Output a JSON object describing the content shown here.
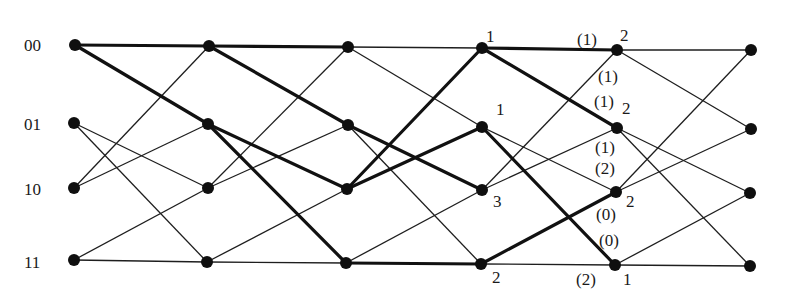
{
  "diagram": {
    "type": "trellis",
    "colors": {
      "background": "#ffffff",
      "edge": "#1e1e1e",
      "edge_survivor": "#111111",
      "node": "#0f0f0f",
      "text": "#1a1a1a"
    },
    "states": [
      "00",
      "01",
      "10",
      "11"
    ],
    "state_labels": [
      {
        "text": "00",
        "x": 24,
        "y": 51
      },
      {
        "text": "01",
        "x": 24,
        "y": 130
      },
      {
        "text": "10",
        "x": 24,
        "y": 195
      },
      {
        "text": "11",
        "x": 24,
        "y": 268
      }
    ],
    "columns": [
      {
        "index": 0,
        "nodes": [
          [
            75,
            45
          ],
          [
            74,
            123
          ],
          [
            74,
            188
          ],
          [
            74,
            260
          ]
        ]
      },
      {
        "index": 1,
        "nodes": [
          [
            209,
            46
          ],
          [
            208,
            124
          ],
          [
            208,
            188
          ],
          [
            207,
            262
          ]
        ]
      },
      {
        "index": 2,
        "nodes": [
          [
            348,
            47
          ],
          [
            348,
            125
          ],
          [
            347,
            189
          ],
          [
            346,
            263
          ]
        ]
      },
      {
        "index": 3,
        "nodes": [
          [
            482,
            48
          ],
          [
            482,
            127
          ],
          [
            482,
            190
          ],
          [
            481,
            264
          ]
        ]
      },
      {
        "index": 4,
        "nodes": [
          [
            617,
            50
          ],
          [
            617,
            128
          ],
          [
            616,
            192
          ],
          [
            615,
            265
          ]
        ]
      },
      {
        "index": 5,
        "nodes": [
          [
            751,
            50
          ],
          [
            751,
            129
          ],
          [
            750,
            193
          ],
          [
            750,
            266
          ]
        ]
      }
    ],
    "transitions": [
      [
        0,
        0
      ],
      [
        0,
        1
      ],
      [
        1,
        2
      ],
      [
        1,
        3
      ],
      [
        2,
        0
      ],
      [
        2,
        1
      ],
      [
        3,
        2
      ],
      [
        3,
        3
      ]
    ],
    "sections": [
      {
        "from": 0,
        "to": 1,
        "bold": [
          [
            0,
            0
          ],
          [
            0,
            1
          ]
        ],
        "thin": [
          [
            1,
            2
          ],
          [
            1,
            3
          ],
          [
            2,
            0
          ],
          [
            2,
            1
          ],
          [
            3,
            2
          ],
          [
            3,
            3
          ]
        ],
        "sources": [
          0,
          1,
          2,
          3
        ]
      },
      {
        "from": 1,
        "to": 2,
        "bold": [
          [
            0,
            0
          ],
          [
            0,
            1
          ],
          [
            1,
            2
          ],
          [
            1,
            3
          ]
        ],
        "thin": [
          [
            2,
            0
          ],
          [
            2,
            1
          ],
          [
            3,
            2
          ],
          [
            3,
            3
          ]
        ]
      },
      {
        "from": 2,
        "to": 3,
        "bold": [
          [
            1,
            2
          ],
          [
            2,
            0
          ],
          [
            2,
            1
          ],
          [
            3,
            3
          ]
        ],
        "thin": [
          [
            0,
            0
          ],
          [
            0,
            1
          ],
          [
            1,
            3
          ],
          [
            3,
            2
          ]
        ]
      },
      {
        "from": 3,
        "to": 4,
        "bold": [
          [
            0,
            0
          ],
          [
            0,
            1
          ],
          [
            1,
            3
          ],
          [
            3,
            2
          ]
        ],
        "thin": [
          [
            1,
            2
          ],
          [
            2,
            0
          ],
          [
            2,
            1
          ],
          [
            3,
            3
          ]
        ]
      },
      {
        "from": 4,
        "to": 5,
        "bold": [],
        "thin": [
          [
            0,
            0
          ],
          [
            0,
            1
          ],
          [
            1,
            2
          ],
          [
            1,
            3
          ],
          [
            2,
            0
          ],
          [
            2,
            1
          ],
          [
            3,
            2
          ],
          [
            3,
            3
          ]
        ]
      }
    ],
    "path_metrics": [
      {
        "column": 3,
        "state": "00",
        "text": "1",
        "x": 486,
        "y": 42
      },
      {
        "column": 3,
        "state": "01",
        "text": "1",
        "x": 496,
        "y": 115
      },
      {
        "column": 3,
        "state": "10",
        "text": "3",
        "x": 493,
        "y": 207
      },
      {
        "column": 3,
        "state": "11",
        "text": "2",
        "x": 492,
        "y": 283
      },
      {
        "column": 4,
        "state": "00",
        "text": "2",
        "x": 620,
        "y": 41
      },
      {
        "column": 4,
        "state": "01",
        "text": "2",
        "x": 622,
        "y": 114
      },
      {
        "column": 4,
        "state": "10",
        "text": "2",
        "x": 626,
        "y": 207
      },
      {
        "column": 4,
        "state": "11",
        "text": "1",
        "x": 623,
        "y": 285
      }
    ],
    "branch_metrics": [
      {
        "text": "(1)",
        "x": 577,
        "y": 45
      },
      {
        "text": "(1)",
        "x": 598,
        "y": 82
      },
      {
        "text": "(1)",
        "x": 594,
        "y": 107
      },
      {
        "text": "(1)",
        "x": 595,
        "y": 153
      },
      {
        "text": "(2)",
        "x": 595,
        "y": 174
      },
      {
        "text": "(0)",
        "x": 596,
        "y": 220
      },
      {
        "text": "(0)",
        "x": 599,
        "y": 246
      },
      {
        "text": "(2)",
        "x": 576,
        "y": 285
      }
    ]
  }
}
